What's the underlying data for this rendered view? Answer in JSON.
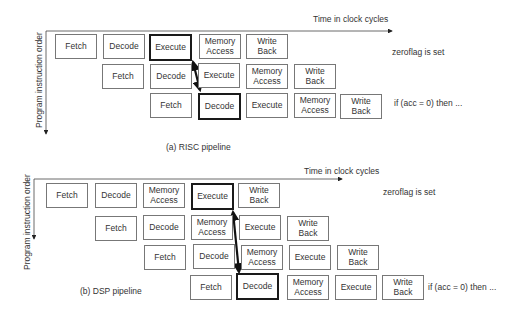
{
  "risc": {
    "time_axis_label": "Time in clock cycles",
    "order_axis_label": "Program instruction order",
    "caption": "(a) RISC pipeline",
    "note_zeroflag": "zeroflag is set",
    "note_if": "if (acc = 0) then ...",
    "rows": [
      {
        "stages": [
          {
            "label": "Fetch"
          },
          {
            "label": "Decode"
          },
          {
            "label": "Execute",
            "highlight": true
          },
          {
            "label": "Memory Access"
          },
          {
            "label": "Write Back"
          }
        ]
      },
      {
        "stages": [
          {
            "label": "Fetch"
          },
          {
            "label": "Decode"
          },
          {
            "label": "Execute"
          },
          {
            "label": "Memory Access"
          },
          {
            "label": "Write Back"
          }
        ]
      },
      {
        "stages": [
          {
            "label": "Fetch"
          },
          {
            "label": "Decode",
            "highlight": true
          },
          {
            "label": "Execute"
          },
          {
            "label": "Memory Access"
          },
          {
            "label": "Write Back"
          }
        ]
      }
    ]
  },
  "dsp": {
    "time_axis_label": "Time in clock cycles",
    "order_axis_label": "Program instruction order",
    "caption": "(b) DSP pipeline",
    "note_zeroflag": "zeroflag is set",
    "note_if": "if (acc = 0) then ...",
    "rows": [
      {
        "stages": [
          {
            "label": "Fetch"
          },
          {
            "label": "Decode"
          },
          {
            "label": "Memory Access"
          },
          {
            "label": "Execute",
            "highlight": true
          },
          {
            "label": "Write Back"
          }
        ]
      },
      {
        "stages": [
          {
            "label": "Fetch"
          },
          {
            "label": "Decode"
          },
          {
            "label": "Memory Access"
          },
          {
            "label": "Execute"
          },
          {
            "label": "Write Back"
          }
        ]
      },
      {
        "stages": [
          {
            "label": "Fetch"
          },
          {
            "label": "Decode"
          },
          {
            "label": "Memory Access"
          },
          {
            "label": "Execute"
          },
          {
            "label": "Write Back"
          }
        ]
      },
      {
        "stages": [
          {
            "label": "Fetch"
          },
          {
            "label": "Decode",
            "highlight": true
          },
          {
            "label": "Memory Access"
          },
          {
            "label": "Execute"
          },
          {
            "label": "Write Back"
          }
        ]
      }
    ]
  }
}
